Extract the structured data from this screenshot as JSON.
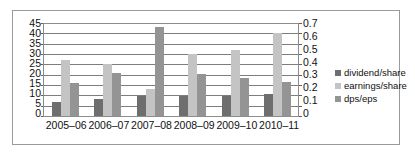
{
  "chart_data": {
    "type": "bar",
    "title": "",
    "xlabel": "",
    "ylabel": "",
    "grid": true,
    "legend_position": "right",
    "categories": [
      "2005–06",
      "2006–07",
      "2007–08",
      "2008–09",
      "2009–10",
      "2010–11"
    ],
    "series": [
      {
        "name": "dividend/share",
        "axis": "left",
        "color": "#6e6e6e",
        "values": [
          7,
          8,
          9.5,
          9.5,
          9.5,
          10.5
        ]
      },
      {
        "name": "earnings/share",
        "axis": "left",
        "color": "#c4c4c4",
        "values": [
          27,
          25,
          13,
          30,
          32,
          40
        ]
      },
      {
        "name": "dps/eps",
        "axis": "right",
        "color": "#949494",
        "values": [
          16,
          21,
          43,
          20.5,
          18.5,
          16.5
        ]
      }
    ],
    "left_axis": {
      "ylim": [
        0,
        45
      ],
      "ticks": [
        45,
        40,
        35,
        30,
        25,
        20,
        15,
        10,
        5,
        0
      ],
      "tick_labels": [
        "45",
        "40",
        "35",
        "30",
        "25",
        "20",
        "15",
        "10",
        "5",
        "0"
      ]
    },
    "right_axis": {
      "ylim": [
        0,
        0.7
      ],
      "ticks": [
        0.7,
        0.6,
        0.5,
        0.4,
        0.3,
        0.2,
        0.1,
        0
      ],
      "tick_labels": [
        "0.7",
        "0.6",
        "0.5",
        "0.4",
        "0.3",
        "0.2",
        "0.1",
        "0"
      ]
    },
    "legend": [
      "dividend/share",
      "earnings/share",
      "dps/eps"
    ]
  }
}
